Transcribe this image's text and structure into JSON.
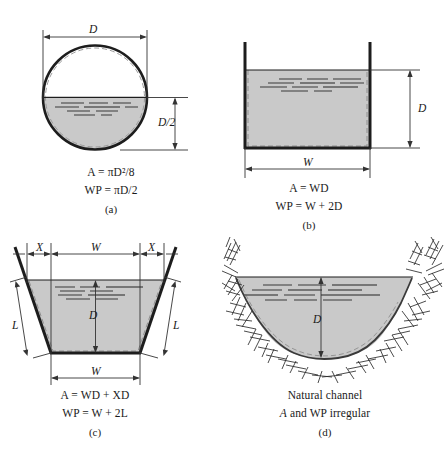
{
  "figure": {
    "colors": {
      "water_fill": "#c9c9c9",
      "outline": "#1d1d1d",
      "ripple": "#555555",
      "dim_line": "#333333",
      "bank_hatch": "#2b2b2b",
      "background": "#ffffff"
    }
  },
  "panels": [
    {
      "id": "a",
      "letter": "(a)",
      "shape": "circular-pipe-half-full",
      "dimensions": [
        {
          "name": "width-dimension",
          "label": "D",
          "orientation": "horizontal"
        },
        {
          "name": "depth-dimension",
          "label": "D/2",
          "orientation": "vertical"
        }
      ],
      "formulas": {
        "area": "A = πD²/8",
        "area_lhs": "A",
        "area_rhs": "πD²/8",
        "wetted_perimeter": "WP = πD/2",
        "wp_lhs": "WP",
        "wp_rhs": "πD/2"
      }
    },
    {
      "id": "b",
      "letter": "(b)",
      "shape": "rectangular-channel",
      "dimensions": [
        {
          "name": "width-dimension",
          "label": "W",
          "orientation": "horizontal"
        },
        {
          "name": "depth-dimension",
          "label": "D",
          "orientation": "vertical"
        }
      ],
      "formulas": {
        "area": "A = WD",
        "area_lhs": "A",
        "area_rhs": "WD",
        "wetted_perimeter": "WP = W + 2D",
        "wp_lhs": "WP",
        "wp_rhs": "W + 2D"
      }
    },
    {
      "id": "c",
      "letter": "(c)",
      "shape": "trapezoidal-channel",
      "dimensions": [
        {
          "name": "side-offset-left",
          "label": "X",
          "orientation": "horizontal"
        },
        {
          "name": "top-width-dimension",
          "label": "W",
          "orientation": "horizontal"
        },
        {
          "name": "side-offset-right",
          "label": "X",
          "orientation": "horizontal"
        },
        {
          "name": "depth-dimension",
          "label": "D",
          "orientation": "vertical"
        },
        {
          "name": "slope-length-left",
          "label": "L",
          "orientation": "diagonal"
        },
        {
          "name": "slope-length-right",
          "label": "L",
          "orientation": "diagonal"
        },
        {
          "name": "bottom-width-dimension",
          "label": "W",
          "orientation": "horizontal"
        }
      ],
      "formulas": {
        "area": "A = WD + XD",
        "area_lhs": "A",
        "area_rhs": "WD + XD",
        "wetted_perimeter": "WP = W + 2L",
        "wp_lhs": "WP",
        "wp_rhs": "W + 2L"
      }
    },
    {
      "id": "d",
      "letter": "(d)",
      "shape": "natural-irregular-channel",
      "dimensions": [
        {
          "name": "depth-dimension",
          "label": "D",
          "orientation": "vertical"
        }
      ],
      "caption_line1": "Natural channel",
      "caption_line2_lhs": "A",
      "caption_line2_rest": " and WP irregular"
    }
  ]
}
